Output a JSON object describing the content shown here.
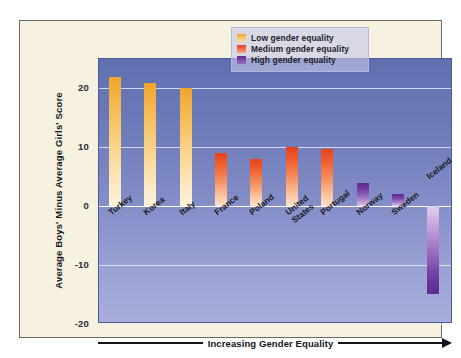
{
  "chart_data": {
    "type": "bar",
    "title": "",
    "xlabel": "Increasing Gender Equality",
    "ylabel": "Average Boys' Minus Average Girls' Score",
    "ylim": [
      -20,
      25
    ],
    "yticks": [
      20,
      10,
      0,
      -10,
      -20
    ],
    "ytick_labels": [
      "20",
      "10",
      "0",
      "-10",
      "-20"
    ],
    "grid": true,
    "legend_position": "top-right",
    "categories": [
      "Turkey",
      "Korea",
      "Italy",
      "France",
      "Poland",
      "United States",
      "Portugal",
      "Norway",
      "Sweden",
      "Iceland"
    ],
    "values": [
      22,
      21,
      20,
      9,
      8,
      10,
      9.7,
      4,
      2,
      -15
    ],
    "group_by_point": [
      "low",
      "low",
      "low",
      "medium",
      "medium",
      "medium",
      "medium",
      "high",
      "high",
      "high"
    ],
    "series": [
      {
        "name": "Low gender equality",
        "color": "#f0a52e",
        "points": [
          {
            "category": "Turkey",
            "value": 22
          },
          {
            "category": "Korea",
            "value": 21
          },
          {
            "category": "Italy",
            "value": 20
          }
        ]
      },
      {
        "name": "Medium gender equality",
        "color": "#e8401d",
        "points": [
          {
            "category": "France",
            "value": 9
          },
          {
            "category": "Poland",
            "value": 8
          },
          {
            "category": "United States",
            "value": 10
          },
          {
            "category": "Portugal",
            "value": 9.7
          }
        ]
      },
      {
        "name": "High gender equality",
        "color": "#5c2b8f",
        "points": [
          {
            "category": "Norway",
            "value": 4
          },
          {
            "category": "Sweden",
            "value": 2
          },
          {
            "category": "Iceland",
            "value": -15
          }
        ]
      }
    ]
  },
  "legend": {
    "items": [
      {
        "label": "Low gender equality",
        "color": "#f0a52e"
      },
      {
        "label": "Medium gender equality",
        "color": "#e8401d"
      },
      {
        "label": "High gender equality",
        "color": "#5c2b8f"
      }
    ]
  },
  "axes": {
    "y_title": "Average Boys' Minus Average Girls' Score",
    "y_ticks": [
      "20",
      "10",
      "0",
      "-10",
      "-20"
    ],
    "x_caption": "Increasing Gender Equality",
    "x_labels": [
      {
        "label": "Turkey"
      },
      {
        "label": "Korea"
      },
      {
        "label": "Italy"
      },
      {
        "label": "France"
      },
      {
        "label": "Poland"
      },
      {
        "label": "United\nStates"
      },
      {
        "label": "Portugal"
      },
      {
        "label": "Norway"
      },
      {
        "label": "Sweden"
      },
      {
        "label": "Iceland"
      }
    ]
  },
  "colors": {
    "page_background": "#ffffff",
    "panel_background": "#f7f2df",
    "panel_border": "#6d6a5c",
    "plot_top": "#5f6fb0",
    "plot_bottom": "#a7aedb",
    "gridline": "#e8ecf7",
    "zero_line": "#ffffff",
    "low": "#f0a52e",
    "medium": "#e8401d",
    "high": "#5c2b8f",
    "text": "#13131a"
  }
}
